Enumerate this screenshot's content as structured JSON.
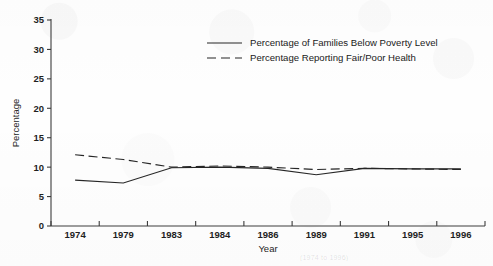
{
  "figure": {
    "background_color": "#fefefe",
    "ink_color": "#262626",
    "caption_fragment": "(1974 to 1996)"
  },
  "chart_data": {
    "type": "line",
    "title": "",
    "xlabel": "Year",
    "ylabel": "Percentage",
    "categories": [
      "1974",
      "1979",
      "1983",
      "1984",
      "1986",
      "1989",
      "1991",
      "1995",
      "1996"
    ],
    "ylim": [
      0,
      35
    ],
    "y_ticks": [
      0,
      5,
      10,
      15,
      20,
      25,
      30,
      35
    ],
    "grid": false,
    "legend_position": "upper-center",
    "series": [
      {
        "name": "Percentage of Families Below Poverty Level",
        "style": "solid",
        "values": [
          7.8,
          7.3,
          9.9,
          10.0,
          9.8,
          8.7,
          9.8,
          9.7,
          9.7
        ]
      },
      {
        "name": "Percentage Reporting Fair/Poor Health",
        "style": "dashed",
        "values": [
          12.1,
          11.3,
          10.0,
          10.2,
          10.0,
          9.6,
          9.8,
          9.7,
          9.6
        ]
      }
    ]
  }
}
